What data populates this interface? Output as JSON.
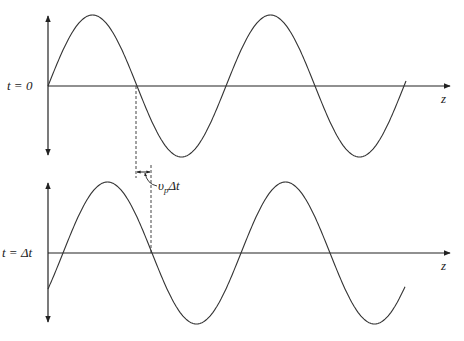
{
  "diagram": {
    "panels": [
      {
        "id": "top",
        "time_label": "t = 0",
        "axis_label": "z",
        "phase_shift_px": 0
      },
      {
        "id": "bottom",
        "time_label": "t = Δt",
        "axis_label": "z",
        "phase_shift_px": 15
      }
    ],
    "displacement_label": {
      "v": "υ",
      "sub": "p",
      "rest": "Δt"
    },
    "colors": {
      "axis": "#222222",
      "curve": "#333333",
      "dashed": "#444444"
    }
  }
}
